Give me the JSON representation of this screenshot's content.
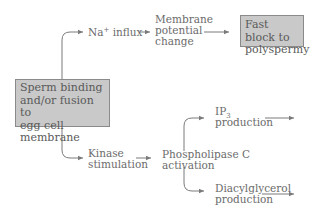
{
  "diagram": {
    "source_box": {
      "line1": "Sperm binding",
      "line2": "and/or fusion to",
      "line3": "egg cell membrane"
    },
    "upper_path": {
      "na_influx": {
        "base": "Na",
        "sup": "+",
        "rest": " influx"
      },
      "membrane": {
        "line1": "Membrane",
        "line2": "potential",
        "line3": "change"
      },
      "result_box": {
        "line1": "Fast block to",
        "line2": "polyspermy"
      }
    },
    "lower_path": {
      "kinase": {
        "line1": "Kinase",
        "line2": "stimulation"
      },
      "plc": {
        "line1": "Phospholipase C",
        "line2": "activation"
      },
      "ip3": {
        "base": "IP",
        "sub": "3",
        "line2": "production"
      },
      "dag": {
        "line1": "Diacylglycerol",
        "line2": "production"
      }
    },
    "colors": {
      "box_fill": "#c9c9c9",
      "box_border": "#8a8a8a",
      "text": "#6b6b6b",
      "arrow": "#7a7a7a"
    }
  }
}
